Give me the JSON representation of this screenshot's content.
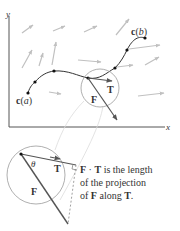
{
  "axes": {
    "x_label": "x",
    "y_label": "y"
  },
  "curve": {
    "start_label_prefix": "c",
    "start_label_arg": "a",
    "end_label_prefix": "c",
    "end_label_arg": "b",
    "points": [
      [
        28,
        93
      ],
      [
        35,
        82
      ],
      [
        54,
        71
      ],
      [
        88,
        78
      ],
      [
        115,
        68
      ],
      [
        127,
        50
      ],
      [
        145,
        38
      ]
    ]
  },
  "vectors": {
    "F_label": "F",
    "T_label": "T"
  },
  "inset": {
    "theta_label": "θ",
    "F_label": "F",
    "T_label": "T"
  },
  "caption": {
    "line1_bold_a": "F",
    "line1_dot": " · ",
    "line1_bold_b": "T",
    "line1_rest": " is the length",
    "line2": "of the projection",
    "line3_pre": "of ",
    "line3_bold": "F",
    "line3_mid": " along ",
    "line3_bold2": "T",
    "line3_end": "."
  },
  "colors": {
    "curve": "#333333",
    "field_arrows": "#b8b8b8",
    "vector": "#555555",
    "circle": "#9a9a9a"
  }
}
